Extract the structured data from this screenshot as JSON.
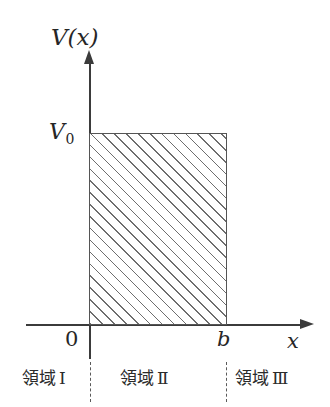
{
  "figure": {
    "type": "potential-barrier-diagram",
    "axes": {
      "y_label": "V(x)",
      "x_label": "x",
      "origin_label": "0"
    },
    "levels": {
      "barrier_height_label": "V",
      "barrier_height_subscript": "0",
      "barrier_right_label": "b"
    },
    "regions": [
      {
        "name": "領域",
        "numeral": "Ⅰ"
      },
      {
        "name": "領域",
        "numeral": "Ⅱ"
      },
      {
        "name": "領域",
        "numeral": "Ⅲ"
      }
    ]
  },
  "chart_data": {
    "type": "line",
    "title": "",
    "xlabel": "x",
    "ylabel": "V(x)",
    "x": [
      0,
      0,
      1,
      1
    ],
    "values": [
      0,
      1,
      1,
      0
    ],
    "xlim": [
      0,
      1.55
    ],
    "ylim": [
      0,
      1.38
    ],
    "xticks": [
      "0",
      "b"
    ],
    "yticks": [
      "V0"
    ],
    "grid": false,
    "legend": "none",
    "annotations": [
      "領域Ⅰ",
      "領域Ⅱ",
      "領域Ⅲ"
    ],
    "shaded_region": {
      "x_from": "0",
      "x_to": "b",
      "y_from": 0,
      "y_to": "V0",
      "fill": "diagonal-hatch"
    }
  },
  "colors": {
    "axis": "#3b3b3b",
    "barrier_border": "#555555",
    "hatch": "#6e6e6e",
    "text": "#262626",
    "background": "#ffffff"
  }
}
